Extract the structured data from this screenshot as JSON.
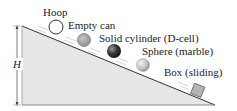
{
  "diagram": {
    "type": "inclined-plane",
    "height_label": "H",
    "objects": [
      {
        "name": "hoop",
        "label": "Hoop"
      },
      {
        "name": "empty-can",
        "label": "Empty can"
      },
      {
        "name": "solid-cylinder",
        "label": "Solid cylinder (D-cell)"
      },
      {
        "name": "sphere",
        "label": "Sphere (marble)"
      },
      {
        "name": "box",
        "label": "Box (sliding)"
      }
    ],
    "colors": {
      "incline_fill": "#e6e6e6",
      "incline_edge": "#333333",
      "can": "#a8a8a8",
      "cylinder": "#3a3a3a",
      "sphere": "#c8c8c8",
      "box": "#b5b5b5"
    }
  }
}
